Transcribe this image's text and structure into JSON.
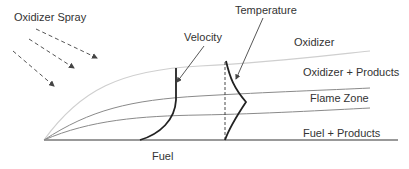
{
  "diagram": {
    "labels": {
      "oxidizer_spray": "Oxidizer Spray",
      "velocity": "Velocity",
      "temperature": "Temperature",
      "oxidizer": "Oxidizer",
      "oxidizer_products": "Oxidizer + Products",
      "flame_zone": "Flame Zone",
      "fuel_products": "Fuel + Products",
      "fuel": "Fuel"
    },
    "colors": {
      "text": "#333333",
      "profile": "#222222",
      "oxidizer_curve": "#cfcfcf",
      "zone_curves": "#8a8a8a",
      "baseline": "#777777",
      "spray_arrows": "#555555"
    }
  }
}
